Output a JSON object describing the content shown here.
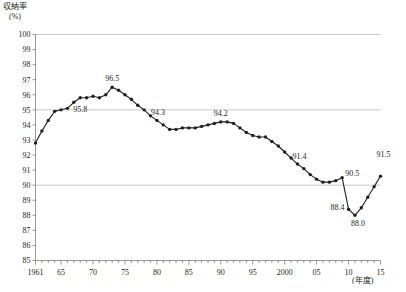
{
  "chart_data": {
    "type": "line",
    "title": "",
    "ylabel": "収納率",
    "yunit": "(%)",
    "xlabel": "",
    "xunit": "(年度)",
    "ylim": [
      85,
      100
    ],
    "ytick_step": 1,
    "ytick_labels": [
      "100",
      "99",
      "98",
      "97",
      "96",
      "95",
      "94",
      "93",
      "92",
      "91",
      "90",
      "89",
      "88",
      "87",
      "86",
      "85"
    ],
    "xtick_labels": [
      "1961",
      "65",
      "70",
      "75",
      "80",
      "85",
      "90",
      "95",
      "2000",
      "05",
      "10",
      "15"
    ],
    "xtick_years": [
      1961,
      1965,
      1970,
      1975,
      1980,
      1985,
      1990,
      1995,
      2000,
      2005,
      2010,
      2015
    ],
    "xlim": [
      1961,
      2015
    ],
    "grid": "horizontal gridlines at 95 and 90",
    "gridline_values": [
      95,
      90
    ],
    "marker": "filled-circle",
    "line_color": "#231f20",
    "grid_color": "#b3b3b3",
    "axis_color": "#808080",
    "x": [
      1961,
      1962,
      1963,
      1964,
      1965,
      1966,
      1967,
      1968,
      1969,
      1970,
      1971,
      1972,
      1973,
      1974,
      1975,
      1976,
      1977,
      1978,
      1979,
      1980,
      1981,
      1982,
      1983,
      1984,
      1985,
      1986,
      1987,
      1988,
      1989,
      1990,
      1991,
      1992,
      1993,
      1994,
      1995,
      1996,
      1997,
      1998,
      1999,
      2000,
      2001,
      2002,
      2003,
      2004,
      2005,
      2006,
      2007,
      2008,
      2009,
      2010,
      2011,
      2012,
      2013,
      2014,
      2015
    ],
    "values": [
      92.8,
      93.6,
      94.3,
      94.9,
      95.0,
      95.1,
      95.5,
      95.8,
      95.8,
      95.9,
      95.8,
      96.0,
      96.5,
      96.3,
      96.0,
      95.7,
      95.3,
      95.0,
      94.6,
      94.3,
      94.0,
      93.7,
      93.7,
      93.8,
      93.8,
      93.8,
      93.9,
      94.0,
      94.1,
      94.2,
      94.2,
      94.1,
      93.8,
      93.5,
      93.3,
      93.2,
      93.2,
      92.9,
      92.6,
      92.2,
      91.8,
      91.4,
      91.1,
      90.7,
      90.4,
      90.2,
      90.2,
      90.3,
      90.5,
      88.4,
      88.0,
      88.5,
      89.2,
      89.9,
      90.6
    ],
    "labeled_points": [
      {
        "year": 1968,
        "value": 95.8,
        "label": "95.8"
      },
      {
        "year": 1973,
        "value": 96.5,
        "label": "96.5"
      },
      {
        "year": 1980,
        "value": 94.3,
        "label": "94.3"
      },
      {
        "year": 1990,
        "value": 94.2,
        "label": "94.2"
      },
      {
        "year": 2002,
        "value": 91.4,
        "label": "91.4"
      },
      {
        "year": 2009,
        "value": 90.5,
        "label": "90.5"
      },
      {
        "year": 2010,
        "value": 88.4,
        "label": "88.4"
      },
      {
        "year": 2011,
        "value": 88.0,
        "label": "88.0"
      },
      {
        "year": 2015,
        "value": 91.5,
        "label": "91.5"
      }
    ]
  }
}
